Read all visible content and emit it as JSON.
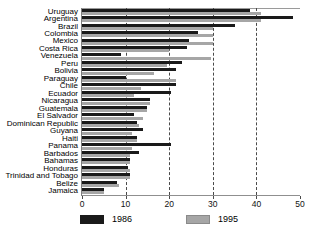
{
  "chart_data": {
    "type": "bar",
    "orientation": "horizontal",
    "title": "",
    "xlabel": "",
    "ylabel": "",
    "xlim": [
      0,
      50
    ],
    "xticks": [
      0,
      10,
      20,
      30,
      40,
      50
    ],
    "gridlines": [
      10,
      20,
      30,
      40
    ],
    "grid": true,
    "legend_position": "bottom",
    "categories": [
      "Uruguay",
      "Argentina",
      "Brazil",
      "Colombia",
      "Mexico",
      "Costa Rica",
      "Venezuela",
      "Peru",
      "Bolivia",
      "Paraguay",
      "Chile",
      "Ecuador",
      "Nicaragua",
      "Guatemala",
      "El Salvador",
      "Dominican Republic",
      "Guyana",
      "Haiti",
      "Panama",
      "Barbados",
      "Bahamas",
      "Honduras",
      "Trinidad and Tobago",
      "Belize",
      "Jamaica"
    ],
    "series": [
      {
        "name": "1986",
        "color": "#1a1a1a",
        "values": [
          38.5,
          48.5,
          35.0,
          26.5,
          24.5,
          24.0,
          9.0,
          23.0,
          21.5,
          10.0,
          21.5,
          20.5,
          15.5,
          15.0,
          12.0,
          12.5,
          14.0,
          12.5,
          20.5,
          13.0,
          11.0,
          10.5,
          11.0,
          8.0,
          5.0
        ]
      },
      {
        "name": "1995",
        "color": "#a6a6a6",
        "values": [
          41.0,
          41.0,
          30.0,
          30.0,
          30.0,
          20.0,
          29.5,
          19.5,
          16.5,
          21.5,
          13.5,
          12.0,
          15.5,
          15.0,
          14.0,
          13.0,
          11.5,
          12.5,
          11.5,
          11.0,
          11.0,
          11.0,
          11.0,
          8.5,
          5.0
        ]
      }
    ]
  },
  "legend": {
    "items": [
      {
        "label": "1986"
      },
      {
        "label": "1995"
      }
    ]
  }
}
